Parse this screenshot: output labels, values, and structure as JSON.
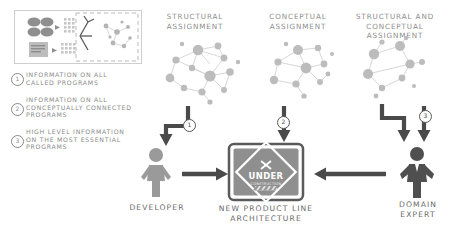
{
  "diagram": {
    "title_bottom_left": "DEVELOPER",
    "title_bottom_center": "NEW PRODUCT LINE\nARCHITECTURE",
    "title_bottom_right": "DOMAIN\nEXPERT"
  },
  "columns": [
    {
      "id": "structural",
      "label": "STRUCTURAL\nASSIGNMENT"
    },
    {
      "id": "conceptual",
      "label": "CONCEPTUAL\nASSIGNMENT"
    },
    {
      "id": "structural_conceptual",
      "label": "STRUCTURAL AND CONCEPTUAL\nASSIGNMENT"
    }
  ],
  "legend": [
    {
      "num": "1",
      "text": "INFORMATION ON ALL\nCALLED PROGRAMS"
    },
    {
      "num": "2",
      "text": "INFORMATION ON ALL\nCONCEPTUALLY CONNECTED\nPROGRAMS"
    },
    {
      "num": "3",
      "text": "HIGH LEVEL INFORMATION\nON THE MOST ESSENTIAL\nPROGRAMS"
    }
  ],
  "arrow_markers": [
    {
      "num": "1"
    },
    {
      "num": "2"
    },
    {
      "num": "3"
    }
  ],
  "sign": {
    "line1": "UNDER",
    "line2": "CONSTRUCTION"
  },
  "actors": {
    "developer": "DEVELOPER",
    "domain_expert": "DOMAIN\nEXPERT",
    "artifact": "NEW PRODUCT LINE\nARCHITECTURE"
  },
  "colors": {
    "text_gray": "#8a8a8a",
    "node_gray": "#bdbdbd",
    "arrow_dark": "#4a4a4a",
    "figure_gray": "#9a9a9a",
    "figure_dark": "#4f4f4f",
    "sign_body": "#8f8f8f",
    "hazard": "#d9d9d9"
  }
}
